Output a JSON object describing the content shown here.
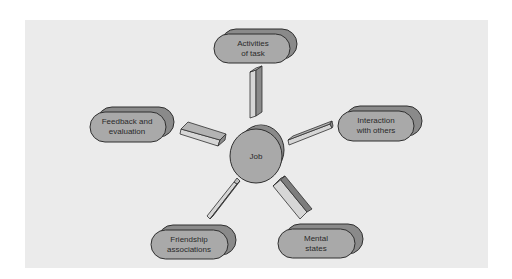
{
  "diagram": {
    "type": "hub-and-spoke",
    "center": {
      "label": "Job"
    },
    "nodes": [
      {
        "id": "activities",
        "line1": "Activities",
        "line2": "of task"
      },
      {
        "id": "interaction",
        "line1": "Interaction",
        "line2": "with others"
      },
      {
        "id": "mental",
        "line1": "Mental",
        "line2": "states"
      },
      {
        "id": "friendship",
        "line1": "Friendship",
        "line2": "associations"
      },
      {
        "id": "feedback",
        "line1": "Feedback and",
        "line2": "evaluation"
      }
    ],
    "colors": {
      "background": "#ebebeb",
      "shape_face": "#a9a9a9",
      "shape_side": "#8a8a8a",
      "shape_top": "#bdbdbd",
      "connector_light": "#d6d6d6",
      "connector_dark": "#7d7d7d",
      "outline": "#2f2f2f"
    }
  }
}
